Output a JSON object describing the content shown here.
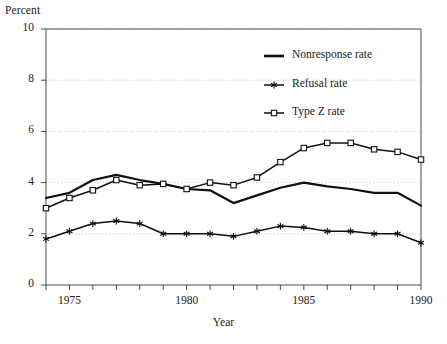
{
  "chart_data": {
    "type": "line",
    "title": "",
    "xlabel": "Year",
    "ylabel": "Percent",
    "xlim": [
      1974,
      1990
    ],
    "ylim": [
      0,
      10
    ],
    "ytick_values": [
      0,
      2,
      4,
      6,
      8,
      10
    ],
    "ytick_labels": [
      "0",
      "2",
      "4",
      "6",
      "8",
      "10"
    ],
    "xtick_values": [
      1975,
      1980,
      1985,
      1990
    ],
    "xtick_labels": [
      "1975",
      "1980",
      "1985",
      "1990"
    ],
    "x": [
      1974,
      1975,
      1976,
      1977,
      1978,
      1979,
      1980,
      1981,
      1982,
      1983,
      1984,
      1985,
      1986,
      1987,
      1988,
      1989,
      1990
    ],
    "grid": "horizontal-dotted",
    "legend_position": "upper-center-right",
    "series": [
      {
        "name": "Nonresponse rate",
        "marker": "none",
        "values": [
          3.4,
          3.6,
          4.1,
          4.3,
          4.1,
          3.95,
          3.75,
          3.7,
          3.2,
          3.5,
          3.8,
          4.0,
          3.85,
          3.75,
          3.6,
          3.6,
          3.1
        ]
      },
      {
        "name": "Refusal rate",
        "marker": "star",
        "values": [
          1.8,
          2.1,
          2.4,
          2.5,
          2.4,
          2.0,
          2.0,
          2.0,
          1.9,
          2.1,
          2.3,
          2.25,
          2.1,
          2.1,
          2.0,
          2.0,
          1.65
        ]
      },
      {
        "name": "Type Z rate",
        "marker": "square",
        "values": [
          3.0,
          3.4,
          3.7,
          4.1,
          3.9,
          3.95,
          3.75,
          4.0,
          3.9,
          4.2,
          4.8,
          5.35,
          5.55,
          5.55,
          5.3,
          5.2,
          4.9
        ]
      }
    ]
  },
  "legend": {
    "entries": [
      {
        "label": "Nonresponse rate"
      },
      {
        "label": "Refusal rate"
      },
      {
        "label": "Type Z rate"
      }
    ]
  }
}
